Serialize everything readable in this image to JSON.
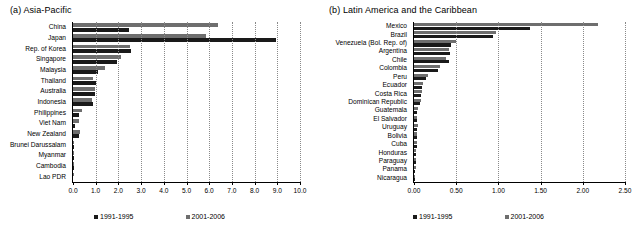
{
  "figure": {
    "panels": [
      {
        "id": "asia-pacific",
        "title": "(a) Asia-Pacific",
        "legend": [
          {
            "label": "1991-1995",
            "color": "#1a1a1a"
          },
          {
            "label": "2001-2006",
            "color": "#6e6e6e"
          }
        ],
        "chart_data": {
          "type": "bar",
          "orientation": "horizontal",
          "title": "(a) Asia-Pacific",
          "xlabel": "",
          "ylabel": "",
          "xlim": [
            0.0,
            10.0
          ],
          "xticks": [
            0.0,
            1.0,
            2.0,
            3.0,
            4.0,
            5.0,
            6.0,
            7.0,
            8.0,
            9.0,
            10.0
          ],
          "xtick_labels": [
            "0.0",
            "1.0",
            "2.0",
            "3.0",
            "4.0",
            "5.0",
            "6.0",
            "7.0",
            "8.0",
            "9.0",
            "10.0"
          ],
          "grid": true,
          "legend_position": "bottom",
          "categories": [
            "China",
            "Japan",
            "Rep. of Korea",
            "Singapore",
            "Malaysia",
            "Thailand",
            "Australia",
            "Indonesia",
            "Philippines",
            "Viet Nam",
            "New Zealand",
            "Brunei Darussalam",
            "Myanmar",
            "Cambodia",
            "Lao PDR"
          ],
          "series": [
            {
              "name": "2001-2006",
              "color": "#6e6e6e",
              "values": [
                6.4,
                5.88,
                2.5,
                2.1,
                1.4,
                0.88,
                0.95,
                0.82,
                0.4,
                0.25,
                0.3,
                0.04,
                0.02,
                0.01,
                0.01
              ]
            },
            {
              "name": "1991-1995",
              "color": "#1a1a1a",
              "values": [
                2.45,
                8.95,
                2.55,
                1.95,
                1.1,
                1.0,
                0.95,
                0.9,
                0.25,
                0.1,
                0.25,
                0.02,
                0.01,
                0.01,
                0.0
              ]
            }
          ]
        }
      },
      {
        "id": "latin-america-caribbean",
        "title": "(b) Latin America and the Caribbean",
        "legend": [
          {
            "label": "1991-1995",
            "color": "#1a1a1a"
          },
          {
            "label": "2001-2006",
            "color": "#6e6e6e"
          }
        ],
        "chart_data": {
          "type": "bar",
          "orientation": "horizontal",
          "title": "(b) Latin America and the Caribbean",
          "xlabel": "",
          "ylabel": "",
          "xlim": [
            0.0,
            2.5
          ],
          "xticks": [
            0.0,
            0.5,
            1.0,
            1.5,
            2.0,
            2.5
          ],
          "xtick_labels": [
            "0.00",
            "0.50",
            "1.00",
            "1.50",
            "2.00",
            "2.50"
          ],
          "grid": true,
          "legend_position": "bottom",
          "categories": [
            "Mexico",
            "Brazil",
            "Venezuela (Bol. Rep. of)",
            "Argentina",
            "Chile",
            "Colombia",
            "Peru",
            "Ecuador",
            "Costa Rica",
            "Dominican Republic",
            "Guatemala",
            "El Salvador",
            "Uruguay",
            "Bolivia",
            "Cuba",
            "Honduras",
            "Paraguay",
            "Panama",
            "Nicaragua"
          ],
          "series": [
            {
              "name": "2001-2006",
              "color": "#6e6e6e",
              "values": [
                2.18,
                0.97,
                0.5,
                0.42,
                0.38,
                0.31,
                0.16,
                0.11,
                0.09,
                0.08,
                0.05,
                0.04,
                0.05,
                0.03,
                0.04,
                0.02,
                0.02,
                0.02,
                0.01
              ]
            },
            {
              "name": "1991-1995",
              "color": "#1a1a1a",
              "values": [
                1.37,
                0.94,
                0.44,
                0.43,
                0.41,
                0.28,
                0.14,
                0.09,
                0.08,
                0.07,
                0.04,
                0.04,
                0.03,
                0.03,
                0.03,
                0.02,
                0.02,
                0.01,
                0.01
              ]
            }
          ]
        }
      }
    ]
  }
}
